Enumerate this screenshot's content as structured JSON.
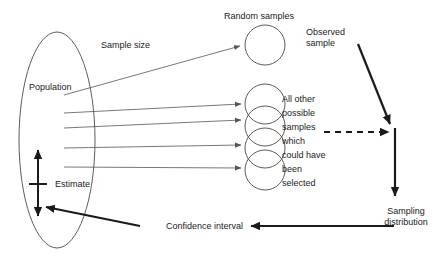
{
  "diagram": {
    "canvas": {
      "width": 446,
      "height": 266
    },
    "colors": {
      "thin_stroke": "#555555",
      "thick_stroke": "#1a1a1a",
      "shape_stroke": "#4a4a4a",
      "text": "#1a1a1a",
      "background": "#ffffff"
    },
    "labels": {
      "population": "Population",
      "sample_size": "Sample size",
      "random_samples": "Random samples",
      "observed_sample_line1": "Observed",
      "observed_sample_line2": "sample",
      "all_other_line1": "All other",
      "all_other_line2": "possible",
      "all_other_line3": "samples",
      "all_other_line4": "which",
      "all_other_line5": "could have",
      "all_other_line6": "been",
      "all_other_line7": "selected",
      "estimate": "Estimate",
      "confidence_interval": "Confidence interval",
      "sampling_distribution_line1": "Sampling",
      "sampling_distribution_line2": "distribution"
    },
    "shapes": {
      "population_ellipse": {
        "cx": 57,
        "cy": 140,
        "rx": 38,
        "ry": 108
      },
      "observed_sample_circle": {
        "cx": 265,
        "cy": 45,
        "r": 20
      },
      "possible_sample_circles": [
        {
          "cx": 265,
          "cy": 104,
          "r": 20
        },
        {
          "cx": 265,
          "cy": 126,
          "r": 20
        },
        {
          "cx": 265,
          "cy": 148,
          "r": 20
        },
        {
          "cx": 265,
          "cy": 170,
          "r": 20
        }
      ]
    },
    "connectors": [
      {
        "name": "population-to-observed-sample",
        "style": "thin-arrow"
      },
      {
        "name": "population-to-possible-sample-1",
        "style": "thin-arrow"
      },
      {
        "name": "population-to-possible-sample-2",
        "style": "thin-arrow"
      },
      {
        "name": "population-to-possible-sample-3",
        "style": "thin-arrow"
      },
      {
        "name": "population-to-possible-sample-4",
        "style": "thin-arrow"
      },
      {
        "name": "observed-sample-to-sampling-point",
        "style": "thick-arrow"
      },
      {
        "name": "possible-samples-to-sampling-point",
        "style": "thick-dashed-arrow"
      },
      {
        "name": "sampling-point-to-distribution",
        "style": "thick-arrow"
      },
      {
        "name": "distribution-to-confidence-interval",
        "style": "thick-arrow"
      },
      {
        "name": "confidence-interval-to-estimate",
        "style": "thick-arrow"
      },
      {
        "name": "estimate-double-arrow",
        "style": "thick-double-arrow"
      }
    ]
  }
}
